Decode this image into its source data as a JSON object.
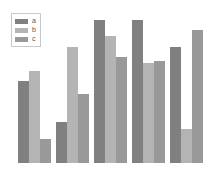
{
  "chart_data": {
    "type": "bar",
    "title": "",
    "subtitle": "",
    "xlabel": "",
    "ylabel": "",
    "grid": false,
    "legend_position": "upper left",
    "ylim": [
      0,
      100
    ],
    "categories": [
      "1",
      "2",
      "3",
      "4",
      "5"
    ],
    "series": [
      {
        "name": "a",
        "color": "#808080",
        "values": [
          57,
          29,
          100,
          100,
          81
        ]
      },
      {
        "name": "b",
        "color": "#b4b4b4",
        "values": [
          64,
          81,
          89,
          70,
          24
        ]
      },
      {
        "name": "c",
        "color": "#999999",
        "values": [
          17,
          48,
          74,
          71,
          93
        ]
      }
    ]
  },
  "legend": {
    "items": [
      {
        "label": "a",
        "color": "#808080"
      },
      {
        "label": "b",
        "color": "#b4b4b4"
      },
      {
        "label": "c",
        "color": "#999999"
      }
    ]
  },
  "axes": {
    "x_tick_labels": [],
    "y_tick_labels": []
  }
}
